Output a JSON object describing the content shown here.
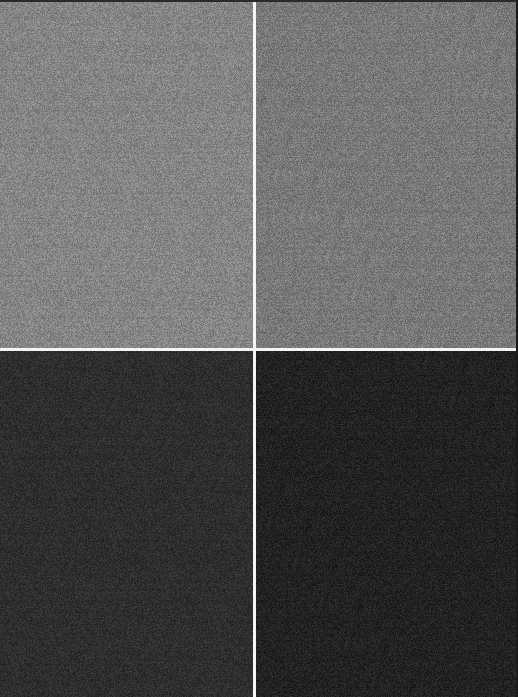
{
  "image": {
    "description": "2x2 grid of gray noise-textured swatches separated by thin white lines",
    "layout": {
      "rows": 2,
      "cols": 2
    },
    "divider_color": "#f4f4f4",
    "panels": [
      {
        "position": "top-left",
        "base_color": "#858585",
        "noise": 22
      },
      {
        "position": "top-right",
        "base_color": "#797979",
        "noise": 22
      },
      {
        "position": "bottom-left",
        "base_color": "#2e2e2e",
        "noise": 14
      },
      {
        "position": "bottom-right",
        "base_color": "#222222",
        "noise": 14
      }
    ]
  }
}
